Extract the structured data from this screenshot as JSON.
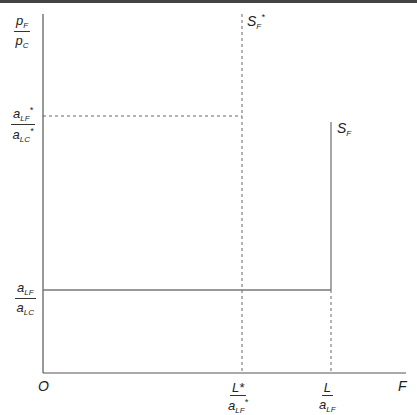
{
  "diagram": {
    "y_axis_label": {
      "num": "p",
      "num_sub": "F",
      "den": "p",
      "den_sub": "C"
    },
    "origin_label": "O",
    "x_axis_label": "F",
    "y_ticks": [
      {
        "num": "a",
        "num_sub": "LF",
        "num_sup": "*",
        "den": "a",
        "den_sub": "LC",
        "den_sup": "*",
        "style": "dashed"
      },
      {
        "num": "a",
        "num_sub": "LF",
        "den": "a",
        "den_sub": "LC",
        "style": "solid"
      }
    ],
    "x_ticks": [
      {
        "num": "L*",
        "den": "a",
        "den_sub": "LF",
        "den_sup": "*"
      },
      {
        "num": "L",
        "den": "a",
        "den_sub": "LF"
      }
    ],
    "curves": [
      {
        "name": "S",
        "sub": "F",
        "sup": "*",
        "style": "dashed vertical"
      },
      {
        "name": "S",
        "sub": "F",
        "style": "solid step"
      }
    ],
    "colors": {
      "axis": "#555555",
      "line": "#777777",
      "topbar": "#444444"
    }
  }
}
